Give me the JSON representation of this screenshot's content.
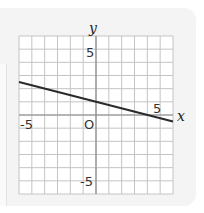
{
  "chart_data": {
    "type": "line",
    "title": "",
    "xlabel": "x",
    "ylabel": "y",
    "xlim": [
      -6,
      6
    ],
    "ylim": [
      -6,
      6
    ],
    "grid": true,
    "grid_step": 1,
    "tick_labels": {
      "x": [
        "-5",
        "5"
      ],
      "y": [
        "5",
        "-5"
      ],
      "origin": "O"
    },
    "series": [
      {
        "name": "line",
        "equation": "y = -x/4 + 1",
        "x": [
          -6,
          6
        ],
        "y": [
          2.5,
          -0.5
        ],
        "color": "#2a2a2a"
      }
    ]
  },
  "labels": {
    "x_axis": "x",
    "y_axis": "y",
    "origin": "O",
    "x_neg5": "-5",
    "x_pos5": "5",
    "y_pos5": "5",
    "y_neg5": "-5"
  }
}
